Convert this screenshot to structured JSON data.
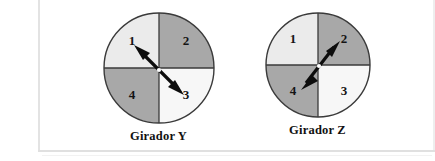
{
  "figure": {
    "type": "spinner-diagram",
    "background_color": "#ffffff",
    "border_color": "#e3e3e3"
  },
  "palette": {
    "sector_light": "#ebebeb",
    "sector_white": "#f7f7f7",
    "sector_medium": "#a8a8a8",
    "outline": "#3a3a3a",
    "arrow": "#0d0d0d",
    "pivot": "#ffffff",
    "label_text": "#141414"
  },
  "spinners": [
    {
      "id": "spinner-y",
      "caption": "Girador Y",
      "sectors": [
        {
          "label": "1",
          "position": "top-left",
          "color": "#ebebeb"
        },
        {
          "label": "2",
          "position": "top-right",
          "color": "#a8a8a8"
        },
        {
          "label": "3",
          "position": "bottom-right",
          "color": "#f7f7f7"
        },
        {
          "label": "4",
          "position": "bottom-left",
          "color": "#a8a8a8"
        }
      ],
      "arrow": {
        "style": "double-headed",
        "points_to": [
          "1",
          "3"
        ],
        "orientation": "up-left to down-right"
      }
    },
    {
      "id": "spinner-z",
      "caption": "Girador Z",
      "sectors": [
        {
          "label": "1",
          "position": "top-left",
          "color": "#ebebeb"
        },
        {
          "label": "2",
          "position": "top-right",
          "color": "#a8a8a8"
        },
        {
          "label": "3",
          "position": "bottom-right",
          "color": "#f7f7f7"
        },
        {
          "label": "4",
          "position": "bottom-left",
          "color": "#a8a8a8"
        }
      ],
      "arrow": {
        "style": "double-headed",
        "points_to": [
          "2",
          "4"
        ],
        "orientation": "up-right to down-left"
      }
    }
  ]
}
